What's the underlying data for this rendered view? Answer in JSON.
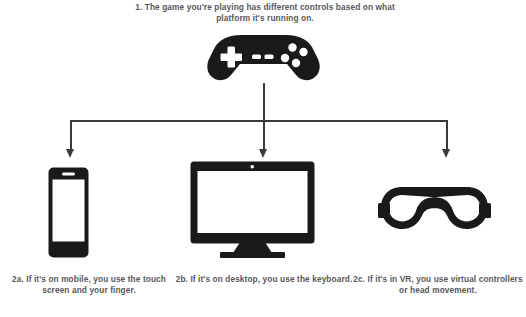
{
  "diagram": {
    "background_color": "#ffffff",
    "ink_color": "#1a1a1a",
    "text_color": "#58585a",
    "connector_color": "#3a3a3a",
    "top_caption": "1. The game you're playing has different controls based on what platform it's running on.",
    "nodes": [
      {
        "id": "gamepad",
        "icon": "gamepad-icon",
        "role": "source",
        "caption": ""
      },
      {
        "id": "mobile",
        "icon": "smartphone-icon",
        "role": "branch",
        "caption": "2a. If it's on mobile, you use the touch screen and your finger."
      },
      {
        "id": "desktop",
        "icon": "desktop-monitor-icon",
        "role": "branch",
        "caption": "2b. If it's on desktop, you use the keyboard."
      },
      {
        "id": "vr",
        "icon": "vr-headset-icon",
        "role": "branch",
        "caption": "2c. If it's in VR, you use virtual controllers or head movement."
      }
    ]
  }
}
